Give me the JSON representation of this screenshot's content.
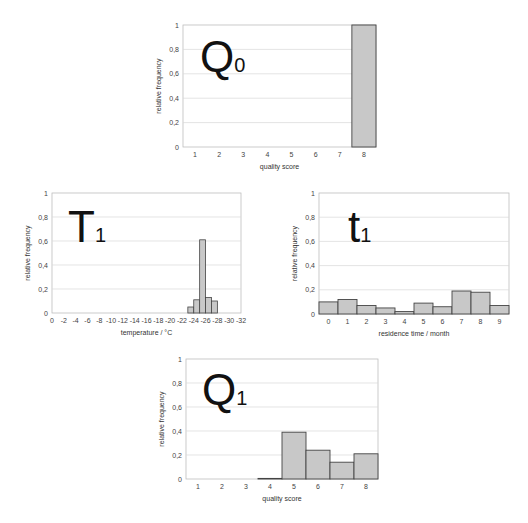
{
  "chart_data": [
    {
      "id": "Q0",
      "type": "bar",
      "panel_label": {
        "main": "Q",
        "sub": "0"
      },
      "categories": [
        "1",
        "2",
        "3",
        "4",
        "5",
        "6",
        "7",
        "8"
      ],
      "values": [
        0,
        0,
        0,
        0,
        0,
        0,
        0,
        1.0
      ],
      "xlabel": "quality score",
      "ylabel": "relative frequency",
      "ylim": [
        0,
        1
      ],
      "yticks": [
        "0",
        "0,2",
        "0,4",
        "0,6",
        "0,8",
        "1"
      ],
      "grid": true
    },
    {
      "id": "T1",
      "type": "bar",
      "panel_label": {
        "main": "T",
        "sub": "1"
      },
      "x_range": [
        0,
        32
      ],
      "xticks": [
        "0",
        "-2",
        "-4",
        "-6",
        "-8",
        "-10",
        "-12",
        "-14",
        "-16",
        "-18",
        "-20",
        "-22",
        "-24",
        "-26",
        "-28",
        "-30",
        "-32"
      ],
      "bins": [
        {
          "from": 23,
          "to": 24,
          "value": 0.05
        },
        {
          "from": 24,
          "to": 25,
          "value": 0.11
        },
        {
          "from": 25,
          "to": 26,
          "value": 0.61
        },
        {
          "from": 26,
          "to": 27,
          "value": 0.13
        },
        {
          "from": 27,
          "to": 28,
          "value": 0.1
        }
      ],
      "xlabel": "temperature / °C",
      "ylabel": "relative frequency",
      "ylim": [
        0,
        1
      ],
      "yticks": [
        "0",
        "0,2",
        "0,4",
        "0,6",
        "0,8",
        "1"
      ],
      "grid": true
    },
    {
      "id": "t1",
      "type": "bar",
      "panel_label": {
        "main": "t",
        "sub": "1"
      },
      "categories": [
        "0",
        "1",
        "2",
        "3",
        "4",
        "5",
        "6",
        "7",
        "8",
        "9"
      ],
      "values": [
        0.1,
        0.12,
        0.07,
        0.05,
        0.02,
        0.09,
        0.06,
        0.19,
        0.18,
        0.07
      ],
      "xlabel": "residence time  / month",
      "ylabel": "relative frequency",
      "ylim": [
        0,
        1
      ],
      "yticks": [
        "0",
        "0,2",
        "0,4",
        "0,6",
        "0,8",
        "1"
      ],
      "grid": true
    },
    {
      "id": "Q1",
      "type": "bar",
      "panel_label": {
        "main": "Q",
        "sub": "1"
      },
      "categories": [
        "1",
        "2",
        "3",
        "4",
        "5",
        "6",
        "7",
        "8"
      ],
      "values": [
        0,
        0,
        0,
        0.005,
        0.39,
        0.24,
        0.14,
        0.21
      ],
      "xlabel": "quality score",
      "ylabel": "relative frequency",
      "ylim": [
        0,
        1
      ],
      "yticks": [
        "0",
        "0,2",
        "0,4",
        "0,6",
        "0,8",
        "1"
      ],
      "grid": true
    }
  ],
  "colors": {
    "bar_fill": "#c8c8c8",
    "bar_stroke": "#444444",
    "grid": "#d8d8d8",
    "frame": "#bdbdbd"
  }
}
